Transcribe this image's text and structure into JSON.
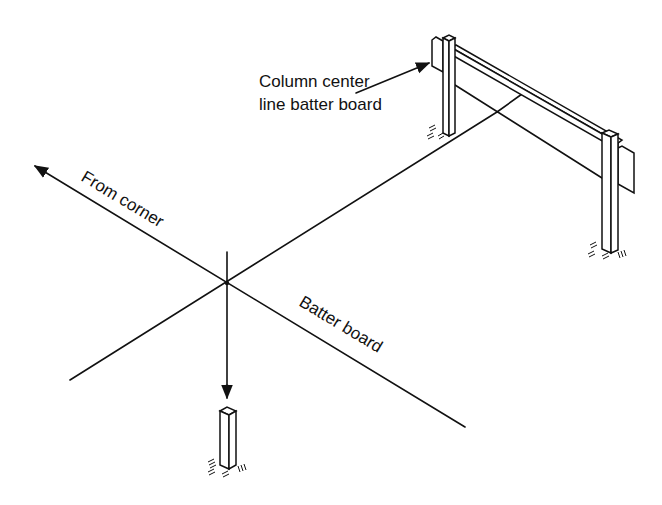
{
  "diagram": {
    "title": "",
    "labels": {
      "column_center_line_1": "Column center",
      "column_center_line_2": "line batter board",
      "from_corner": "From corner",
      "batter_board": "Batter board"
    },
    "elements": [
      {
        "id": "corner-stake",
        "type": "post"
      },
      {
        "id": "left-batter-post",
        "type": "post with board"
      },
      {
        "id": "right-batter-post",
        "type": "post with board"
      },
      {
        "id": "string-line",
        "type": "line"
      },
      {
        "id": "plumb-line",
        "type": "line with arrow"
      }
    ],
    "colors": {
      "ink": "#111111",
      "background": "#ffffff"
    }
  }
}
